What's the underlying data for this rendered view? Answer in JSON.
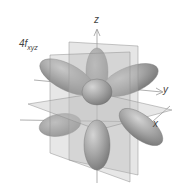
{
  "diagram": {
    "orbital_label": {
      "main": "4f",
      "subscript": "xyz"
    },
    "axes": {
      "z": "z",
      "y": "y",
      "x": "x"
    },
    "colors": {
      "lobe": "#9a9a9a",
      "lobe_highlight": "#c8c8c8",
      "plane": "#b5b5b5",
      "axis": "#888888",
      "background": "#ffffff"
    },
    "lobe_count": 8
  }
}
